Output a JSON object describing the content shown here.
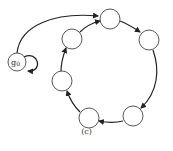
{
  "diagram": {
    "type": "state-cycle",
    "caption": "(c)",
    "start_node_label": "g0",
    "start_node_display": "g",
    "start_node_subscript": "0",
    "nodes": [
      {
        "id": "g0",
        "label": "g0",
        "cx": 17,
        "cy": 62,
        "r": 9
      },
      {
        "id": "n1",
        "label": "",
        "cx": 110,
        "cy": 19,
        "r": 10
      },
      {
        "id": "n2",
        "label": "",
        "cx": 149,
        "cy": 40,
        "r": 10
      },
      {
        "id": "n3",
        "label": "",
        "cx": 133,
        "cy": 116,
        "r": 10
      },
      {
        "id": "n4",
        "label": "",
        "cx": 89,
        "cy": 118,
        "r": 10
      },
      {
        "id": "n5",
        "label": "",
        "cx": 62,
        "cy": 81,
        "r": 10
      },
      {
        "id": "n6",
        "label": "",
        "cx": 72,
        "cy": 39,
        "r": 10
      }
    ],
    "edges": [
      {
        "from": "g0",
        "to": "g0",
        "kind": "self-loop"
      },
      {
        "from": "g0",
        "to": "n1"
      },
      {
        "from": "n1",
        "to": "n2"
      },
      {
        "from": "n2",
        "to": "n3"
      },
      {
        "from": "n3",
        "to": "n4"
      },
      {
        "from": "n4",
        "to": "n5"
      },
      {
        "from": "n5",
        "to": "n6"
      },
      {
        "from": "n6",
        "to": "n1"
      }
    ],
    "colors": {
      "stroke": "#222222",
      "node_fill": "#ffffff"
    }
  }
}
